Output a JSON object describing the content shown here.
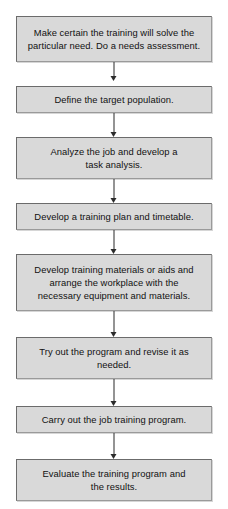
{
  "diagram": {
    "colors": {
      "node_fill": "#d9d9d9",
      "node_border": "#6b6b6b",
      "connector": "#2b2b2b",
      "background": "#ffffff",
      "text": "#111111"
    },
    "nodes": [
      {
        "id": "needs-assessment",
        "text": "Make certain the training will solve the particular need.  Do a needs assessment.",
        "top": 16,
        "height": 46
      },
      {
        "id": "define-target-population",
        "text": "Define the target population.",
        "top": 86,
        "height": 27
      },
      {
        "id": "task-analysis",
        "text": "Analyze the job and develop a\ntask analysis.",
        "top": 137,
        "height": 42
      },
      {
        "id": "training-plan-timetable",
        "text": "Develop a training plan and timetable.",
        "top": 203,
        "height": 27
      },
      {
        "id": "training-materials-workplace",
        "text": "Develop training materials or aids and\narrange the workplace with the\nnecessary equipment and materials.",
        "top": 254,
        "height": 57
      },
      {
        "id": "try-out-and-revise",
        "text": "Try out the program and revise it as\nneeded.",
        "top": 337,
        "height": 42
      },
      {
        "id": "carry-out-program",
        "text": "Carry out the job training program.",
        "top": 406,
        "height": 27
      },
      {
        "id": "evaluate-program",
        "text": "Evaluate the training program and\nthe results.",
        "top": 459,
        "height": 42
      }
    ],
    "connectors": [
      {
        "id": "connector-1",
        "from": "needs-assessment",
        "to": "define-target-population",
        "top": 62,
        "height": 18
      },
      {
        "id": "connector-2",
        "from": "define-target-population",
        "to": "task-analysis",
        "top": 113,
        "height": 18
      },
      {
        "id": "connector-3",
        "from": "task-analysis",
        "to": "training-plan-timetable",
        "top": 179,
        "height": 18
      },
      {
        "id": "connector-4",
        "from": "training-plan-timetable",
        "to": "training-materials-workplace",
        "top": 230,
        "height": 18
      },
      {
        "id": "connector-5",
        "from": "training-materials-workplace",
        "to": "try-out-and-revise",
        "top": 311,
        "height": 20
      },
      {
        "id": "connector-6",
        "from": "try-out-and-revise",
        "to": "carry-out-program",
        "top": 379,
        "height": 21
      },
      {
        "id": "connector-7",
        "from": "carry-out-program",
        "to": "evaluate-program",
        "top": 433,
        "height": 20
      }
    ]
  }
}
